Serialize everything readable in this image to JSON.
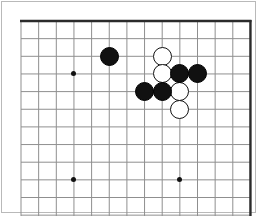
{
  "figure": {
    "name": "go-board-diagram",
    "width": 259,
    "height": 216,
    "background_color": "#ffffff",
    "frame_color": "#b9b9b9",
    "caption": ""
  },
  "board": {
    "type": "go-board",
    "grid_color": "#8f8f8f",
    "edge_color": "#2b2b2b",
    "grid_spacing": 17.65,
    "origin_x": 21,
    "origin_y": 21,
    "columns_visible": 13,
    "rows_visible": 11,
    "edges": {
      "top": true,
      "right": true,
      "left": false,
      "bottom": false
    },
    "hoshi_label": "star-point",
    "hoshi_points": [
      {
        "col": 3,
        "row": 3
      },
      {
        "col": 3,
        "row": 9
      },
      {
        "col": 9,
        "row": 9
      }
    ]
  },
  "stones": {
    "black_label": "black-stone",
    "white_label": "white-stone",
    "black_color": "#111111",
    "white_color": "#ffffff",
    "diameter": 19,
    "list": [
      {
        "color": "black",
        "col": 5,
        "row": 2
      },
      {
        "color": "white",
        "col": 8,
        "row": 2
      },
      {
        "color": "white",
        "col": 8,
        "row": 3
      },
      {
        "color": "black",
        "col": 9,
        "row": 3
      },
      {
        "color": "black",
        "col": 10,
        "row": 3
      },
      {
        "color": "black",
        "col": 7,
        "row": 4
      },
      {
        "color": "black",
        "col": 8,
        "row": 4
      },
      {
        "color": "white",
        "col": 9,
        "row": 4
      },
      {
        "color": "white",
        "col": 9,
        "row": 5
      }
    ]
  },
  "counts": {
    "black_stones": 5,
    "white_stones": 4,
    "total_stones": 9
  }
}
